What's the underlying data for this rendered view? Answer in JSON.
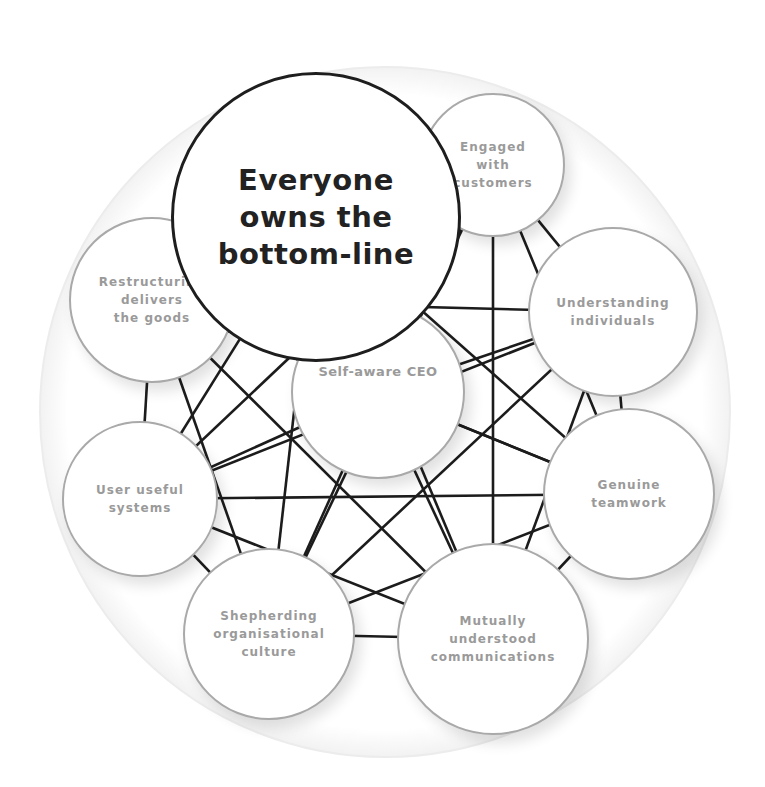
{
  "diagram": {
    "background_circle": {
      "cx": 385,
      "cy": 412,
      "r": 345,
      "color": "#f2f2f2"
    },
    "line_color": "#1c1c1c",
    "nodes": [
      {
        "id": "bottom-line",
        "label": "Everyone\nowns the\nbottom-line",
        "cx": 316,
        "cy": 217,
        "r": 145,
        "style": "main"
      },
      {
        "id": "engaged-customers",
        "label": "Engaged\nwith\ncustomers",
        "cx": 493,
        "cy": 165,
        "r": 72,
        "style": "outer"
      },
      {
        "id": "understanding-individuals",
        "label": "Understanding\nindividuals",
        "cx": 613,
        "cy": 312,
        "r": 85,
        "style": "outer"
      },
      {
        "id": "genuine-teamwork",
        "label": "Genuine\nteamwork",
        "cx": 629,
        "cy": 494,
        "r": 86,
        "style": "outer"
      },
      {
        "id": "mutually-understood-communications",
        "label": "Mutually\nunderstood\ncommunications",
        "cx": 493,
        "cy": 639,
        "r": 96,
        "style": "outer"
      },
      {
        "id": "shepherding-culture",
        "label": "Shepherding\norganisational\nculture",
        "cx": 269,
        "cy": 634,
        "r": 86,
        "style": "outer"
      },
      {
        "id": "user-useful-systems",
        "label": "User useful\nsystems",
        "cx": 140,
        "cy": 499,
        "r": 78,
        "style": "outer"
      },
      {
        "id": "restructuring",
        "label": "Restructuring\ndelivers\nthe goods",
        "cx": 152,
        "cy": 300,
        "r": 83,
        "style": "outer"
      },
      {
        "id": "self-aware-ceo",
        "label": "Self-aware CEO",
        "cx": 378,
        "cy": 392,
        "r": 87,
        "style": "ceo"
      }
    ],
    "edges": [
      [
        1,
        2
      ],
      [
        1,
        3
      ],
      [
        1,
        4
      ],
      [
        1,
        5
      ],
      [
        1,
        6
      ],
      [
        1,
        7
      ],
      [
        1,
        8
      ],
      [
        2,
        3
      ],
      [
        2,
        4
      ],
      [
        2,
        5
      ],
      [
        2,
        6
      ],
      [
        2,
        7
      ],
      [
        2,
        8
      ],
      [
        3,
        4
      ],
      [
        3,
        5
      ],
      [
        3,
        6
      ],
      [
        3,
        7
      ],
      [
        3,
        8
      ],
      [
        4,
        5
      ],
      [
        4,
        6
      ],
      [
        4,
        7
      ],
      [
        4,
        8
      ],
      [
        5,
        6
      ],
      [
        5,
        7
      ],
      [
        5,
        8
      ],
      [
        6,
        7
      ],
      [
        6,
        8
      ],
      [
        7,
        8
      ],
      [
        0,
        3
      ],
      [
        0,
        4
      ],
      [
        0,
        5
      ],
      [
        0,
        6
      ]
    ]
  }
}
